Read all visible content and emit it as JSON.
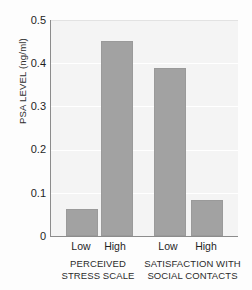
{
  "chart_data": {
    "type": "bar",
    "title": "",
    "xlabel": "",
    "ylabel": "PSA LEVEL (ng/ml)",
    "ylim": [
      0,
      0.5
    ],
    "yticks": [
      "0.5",
      "0.4",
      "0.3",
      "0.2",
      "0.1",
      "0"
    ],
    "ytick_values": [
      0.5,
      0.4,
      0.3,
      0.2,
      0.1,
      0
    ],
    "grid": true,
    "legend": "none",
    "categories": [
      "Low",
      "High",
      "Low",
      "High"
    ],
    "values": [
      0.062,
      0.452,
      0.39,
      0.083
    ],
    "bars": [
      {
        "label": "Low",
        "value": 0.062,
        "group": "PERCEIVED STRESS SCALE"
      },
      {
        "label": "High",
        "value": 0.452,
        "group": "PERCEIVED STRESS SCALE"
      },
      {
        "label": "Low",
        "value": 0.39,
        "group": "SATISFACTION WITH SOCIAL CONTACTS"
      },
      {
        "label": "High",
        "value": 0.083,
        "group": "SATISFACTION WITH SOCIAL CONTACTS"
      }
    ],
    "groups": [
      {
        "line1": "PERCEIVED",
        "line2": "STRESS SCALE"
      },
      {
        "line1": "SATISFACTION WITH",
        "line2": "SOCIAL CONTACTS"
      }
    ],
    "colors": {
      "bar": "#a2a2a2",
      "plot_background": "#f4f4f4",
      "gridline": "#ffffff",
      "axis": "#8c8c8c",
      "text": "#1f1f1f"
    }
  }
}
